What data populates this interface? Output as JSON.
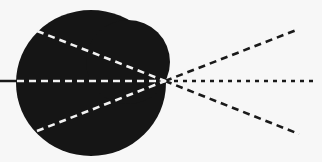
{
  "diagram": {
    "colors": {
      "background": "#f7f7f7",
      "body": "#151515",
      "inner_rays": "#f2f2f2",
      "outer_rays": "#1a1a1a",
      "axis_line": "#1a1a1a"
    },
    "focal_point": {
      "x": 165,
      "y": 81
    },
    "axis_line": {
      "x1": 0,
      "y1": 81,
      "x2": 17,
      "y2": 81
    },
    "inner_rays": [
      {
        "name": "upper-inner-ray",
        "x1": 37,
        "y1": 31
      },
      {
        "name": "center-inner-ray",
        "x1": 17,
        "y1": 81
      },
      {
        "name": "lower-inner-ray",
        "x1": 37,
        "y1": 131
      }
    ],
    "outer_rays": [
      {
        "name": "upper-outer-ray",
        "x2": 299,
        "y2": 29
      },
      {
        "name": "center-outer-ray",
        "x2": 316,
        "y2": 81
      },
      {
        "name": "lower-outer-ray",
        "x2": 299,
        "y2": 134
      }
    ]
  }
}
